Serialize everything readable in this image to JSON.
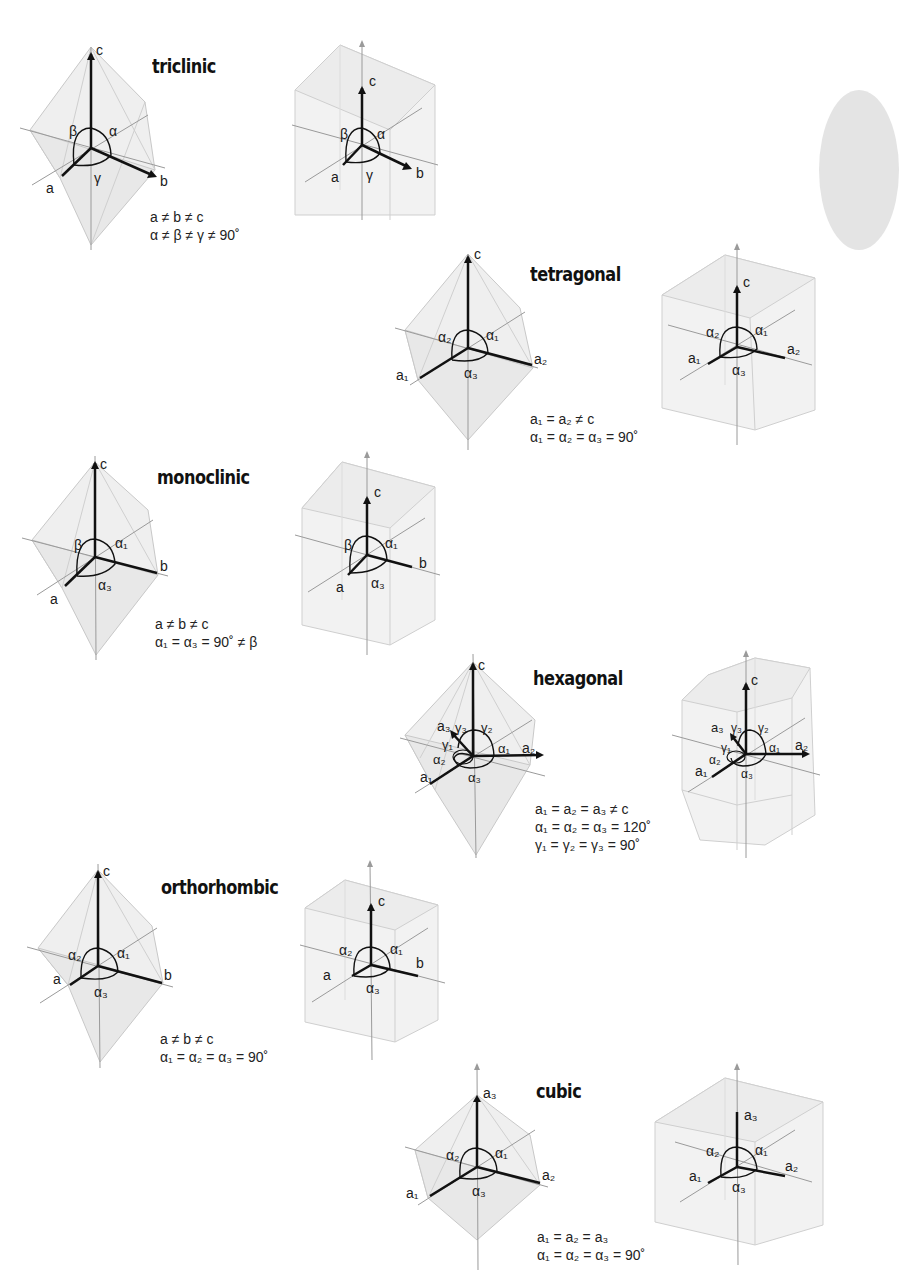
{
  "page": {
    "page_edge_tab_color": "#e4e4e4"
  },
  "colors": {
    "axis_bold": "#111111",
    "axis_light": "#8a8a8a",
    "polyhedron_fill": "#ececec",
    "polyhedron_edge": "#c4c4c4",
    "text": "#1a1a1a"
  },
  "systems": [
    {
      "id": "triclinic",
      "title": "triclinic",
      "eq1": "a ≠ b ≠ c",
      "eq2": "α ≠ β ≠ γ ≠ 90˚",
      "axis_labels": {
        "vertical": "c",
        "left": "a",
        "right": "b"
      },
      "angle_labels": {
        "left": "β",
        "right": "α",
        "bottom": "γ"
      }
    },
    {
      "id": "tetragonal",
      "title": "tetragonal",
      "eq1": "a₁ = a₂ ≠ c",
      "eq2": "α₁ = α₂ = α₃ = 90˚",
      "axis_labels": {
        "vertical": "c",
        "left": "a₁",
        "right": "a₂"
      },
      "angle_labels": {
        "left": "α₂",
        "right": "α₁",
        "bottom": "α₃"
      }
    },
    {
      "id": "monoclinic",
      "title": "monoclinic",
      "eq1": "a ≠ b ≠ c",
      "eq2": "α₁ = α₃ = 90˚ ≠ β",
      "axis_labels": {
        "vertical": "c",
        "left": "a",
        "right": "b"
      },
      "angle_labels": {
        "left": "β",
        "right": "α₁",
        "bottom": "α₃"
      }
    },
    {
      "id": "hexagonal",
      "title": "hexagonal",
      "eq1": "a₁ = a₂ = a₃ ≠ c",
      "eq2": "α₁ = α₂ = α₃ = 120˚",
      "eq3": "γ₁ = γ₂ = γ₃ = 90˚",
      "axis_labels": {
        "vertical": "c",
        "left": "a₁",
        "right": "a₂",
        "back": "a₃"
      },
      "angle_labels": {
        "g1": "γ₁",
        "g2": "γ₂",
        "g3": "γ₃",
        "a1": "α₁",
        "a2": "α₂",
        "a3": "α₃"
      }
    },
    {
      "id": "orthorhombic",
      "title": "orthorhombic",
      "eq1": "a ≠ b ≠ c",
      "eq2": "α₁ = α₂ = α₃ = 90˚",
      "axis_labels": {
        "vertical": "c",
        "left": "a",
        "right": "b"
      },
      "angle_labels": {
        "left": "α₂",
        "right": "α₁",
        "bottom": "α₃"
      }
    },
    {
      "id": "cubic",
      "title": "cubic",
      "eq1": "a₁ = a₂ = a₃",
      "eq2": "α₁ = α₂ = α₃ = 90˚",
      "axis_labels": {
        "vertical": "a₃",
        "left": "a₁",
        "right": "a₂"
      },
      "angle_labels": {
        "left": "α₂",
        "right": "α₁",
        "bottom": "α₃"
      }
    }
  ]
}
